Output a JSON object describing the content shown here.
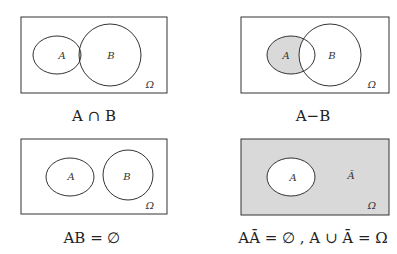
{
  "colors": {
    "shade": "#d9d9d9",
    "stroke": "#333333",
    "background": "#ffffff"
  },
  "panels": [
    {
      "caption": "A ∩ B",
      "labels": {
        "a": "A",
        "b": "B",
        "omega": "Ω"
      },
      "shaded": "intersection"
    },
    {
      "caption": "A−B",
      "labels": {
        "a": "A",
        "b": "B",
        "omega": "Ω"
      },
      "shaded": "difference"
    },
    {
      "caption": "AB = ∅",
      "labels": {
        "a": "A",
        "b": "B",
        "omega": "Ω"
      },
      "shaded": "none"
    },
    {
      "caption": "AĀ = ∅ , A ∪ Ā = Ω",
      "labels": {
        "a": "A",
        "complement": "Ā",
        "omega": "Ω"
      },
      "shaded": "complement"
    }
  ]
}
